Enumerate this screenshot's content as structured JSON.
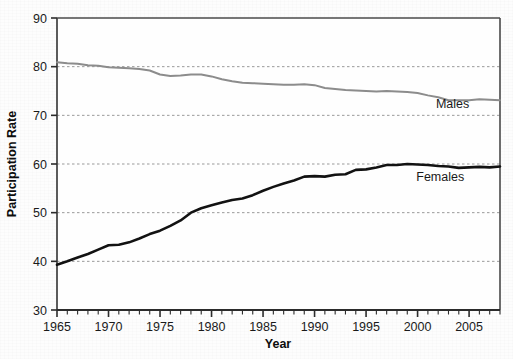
{
  "chart_data": {
    "type": "line",
    "title": "",
    "xlabel": "Year",
    "ylabel": "Participation Rate",
    "xlim": [
      1965,
      2008
    ],
    "ylim": [
      30,
      90
    ],
    "yticks": [
      30,
      40,
      50,
      60,
      70,
      80,
      90
    ],
    "xticks_major": [
      1965,
      1970,
      1975,
      1980,
      1985,
      1990,
      1995,
      2000,
      2005
    ],
    "xtick_minor_step": 1,
    "grid": "horizontal-dashed",
    "legend": "inline-right-labels",
    "x": [
      1965,
      1966,
      1967,
      1968,
      1969,
      1970,
      1971,
      1972,
      1973,
      1974,
      1975,
      1976,
      1977,
      1978,
      1979,
      1980,
      1981,
      1982,
      1983,
      1984,
      1985,
      1986,
      1987,
      1988,
      1989,
      1990,
      1991,
      1992,
      1993,
      1994,
      1995,
      1996,
      1997,
      1998,
      1999,
      2000,
      2001,
      2002,
      2003,
      2004,
      2005,
      2006,
      2007,
      2008
    ],
    "series": [
      {
        "name": "Males",
        "color": "#8c8c8c",
        "width": 2.0,
        "label_text": "Males",
        "label_x": 2003.4,
        "label_y": 71.6,
        "values": [
          80.9,
          80.7,
          80.6,
          80.3,
          80.2,
          79.9,
          79.8,
          79.7,
          79.5,
          79.2,
          78.4,
          78.1,
          78.2,
          78.4,
          78.4,
          78.0,
          77.4,
          77.0,
          76.7,
          76.6,
          76.5,
          76.4,
          76.3,
          76.3,
          76.4,
          76.2,
          75.6,
          75.4,
          75.2,
          75.1,
          75.0,
          74.9,
          75.0,
          74.9,
          74.8,
          74.6,
          74.1,
          73.7,
          73.1,
          73.1,
          73.1,
          73.3,
          73.2,
          73.1
        ]
      },
      {
        "name": "Females",
        "color": "#121212",
        "width": 2.6,
        "label_text": "Females",
        "label_x": 2002.2,
        "label_y": 56.6,
        "values": [
          39.3,
          40.0,
          40.8,
          41.5,
          42.4,
          43.3,
          43.4,
          43.9,
          44.7,
          45.6,
          46.3,
          47.3,
          48.4,
          50.0,
          50.9,
          51.5,
          52.1,
          52.6,
          52.9,
          53.6,
          54.5,
          55.3,
          56.0,
          56.6,
          57.4,
          57.5,
          57.4,
          57.8,
          57.9,
          58.8,
          58.9,
          59.3,
          59.8,
          59.8,
          60.0,
          59.9,
          59.8,
          59.6,
          59.5,
          59.2,
          59.3,
          59.4,
          59.3,
          59.5
        ]
      }
    ]
  }
}
